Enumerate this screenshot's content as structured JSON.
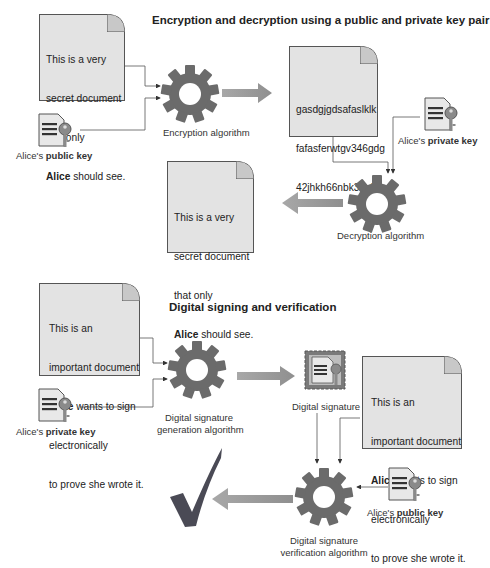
{
  "section1": {
    "title": "Encryption and decryption using a public and private key pair",
    "plaintext_doc": {
      "lines": [
        "This is a very",
        "secret document",
        "that only"
      ],
      "bold_word": "Alice",
      "last_line_rest": " should see."
    },
    "public_key_label": {
      "prefix": "Alice's ",
      "bold": "public key"
    },
    "encryption_label": "Encryption algorithm",
    "ciphertext_doc": {
      "lines": [
        "gasdgjgdsafaslklk",
        "fafasferwtgv346gdg",
        "42jhkh66nbk3kn3kn"
      ]
    },
    "private_key_label": {
      "prefix": "Alice's ",
      "bold": "private key"
    },
    "decryption_label": "Decryption algorithm",
    "decrypted_doc": {
      "lines": [
        "This is a very",
        "secret document",
        "that only"
      ],
      "bold_word": "Alice",
      "last_line_rest": " should see."
    }
  },
  "section2": {
    "title": "Digital signing and verification",
    "document": {
      "lines_before": [
        "This is an",
        "important document"
      ],
      "bold_word": "Alice",
      "bold_line_rest": " wants to sign",
      "lines_after": [
        "electronically",
        "to prove she wrote it."
      ]
    },
    "private_key_label": {
      "prefix": "Alice's ",
      "bold": "private key"
    },
    "generation_label": [
      "Digital signature",
      "generation algorithm"
    ],
    "signature_label": "Digital signature",
    "document_copy": {
      "lines_before": [
        "This is an",
        "important document"
      ],
      "bold_word": "Alice",
      "bold_line_rest": " wants to sign",
      "lines_after": [
        "electronically",
        "to prove she wrote it."
      ]
    },
    "public_key_label": {
      "prefix": "Alice's ",
      "bold": "public key"
    },
    "verification_label": [
      "Digital signature",
      "verification algorithm"
    ]
  },
  "colors": {
    "gear": "#6b6b6b",
    "arrow": "#9a9a9a",
    "doc_fill": "#e3e3e3",
    "checkmark": "#4a4a55"
  }
}
